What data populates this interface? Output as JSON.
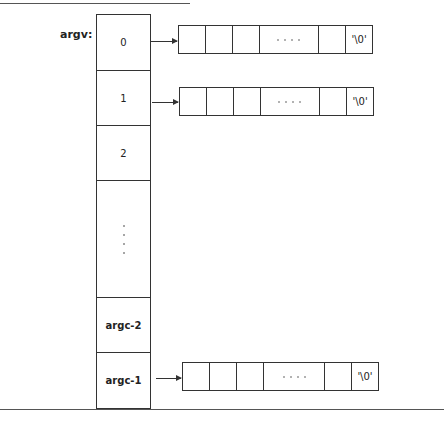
{
  "figure": {
    "variable_label": "argv:",
    "pointer_array": {
      "cells": [
        {
          "label": "0"
        },
        {
          "label": "1"
        },
        {
          "label": "2"
        },
        {
          "label": "",
          "ellipsis": "vertical"
        },
        {
          "label": "argc-2"
        },
        {
          "label": "argc-1"
        }
      ]
    },
    "strings": [
      {
        "from_index": "0",
        "cells": [
          "",
          "",
          "",
          "....",
          "",
          "'\\0'"
        ],
        "terminator": "'\\0'"
      },
      {
        "from_index": "1",
        "cells": [
          "",
          "",
          "",
          "....",
          "",
          "'\\0'"
        ],
        "terminator": "'\\0'"
      },
      {
        "from_index": "argc-1",
        "cells": [
          "",
          "",
          "",
          "....",
          "",
          "'\\0'"
        ],
        "terminator": "'\\0'"
      }
    ]
  }
}
